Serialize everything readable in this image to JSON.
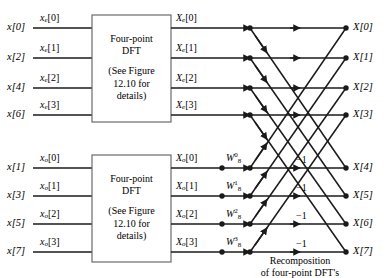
{
  "figure": {
    "line_color": "#1a1a1a",
    "box_stroke": "#6b6b6b",
    "text_color": "#000000"
  },
  "inputs": {
    "even": [
      {
        "x_label": "x[0]",
        "seq_name": "x",
        "seq_sub": "e",
        "seq_index": "[0]",
        "row": 0
      },
      {
        "x_label": "x[2]",
        "seq_name": "x",
        "seq_sub": "e",
        "seq_index": "[1]",
        "row": 1
      },
      {
        "x_label": "x[4]",
        "seq_name": "x",
        "seq_sub": "e",
        "seq_index": "[2]",
        "row": 2
      },
      {
        "x_label": "x[6]",
        "seq_name": "x",
        "seq_sub": "e",
        "seq_index": "[3]",
        "row": 3
      }
    ],
    "odd": [
      {
        "x_label": "x[1]",
        "seq_name": "x",
        "seq_sub": "o",
        "seq_index": "[0]",
        "row": 4
      },
      {
        "x_label": "x[3]",
        "seq_name": "x",
        "seq_sub": "o",
        "seq_index": "[1]",
        "row": 5
      },
      {
        "x_label": "x[5]",
        "seq_name": "x",
        "seq_sub": "o",
        "seq_index": "[2]",
        "row": 6
      },
      {
        "x_label": "x[7]",
        "seq_name": "x",
        "seq_sub": "o",
        "seq_index": "[3]",
        "row": 7
      }
    ]
  },
  "blocks": {
    "top": {
      "line1": "Four-point",
      "line2": "DFT",
      "line3": "(See Figure",
      "line4": "12.10 for",
      "line5": "details)"
    },
    "bottom": {
      "line1": "Four-point",
      "line2": "DFT",
      "line3": "(See Figure",
      "line4": "12.10 for",
      "line5": "details)"
    }
  },
  "block_outputs": {
    "even": [
      {
        "name": "X",
        "sub": "e",
        "index": "[0]"
      },
      {
        "name": "X",
        "sub": "e",
        "index": "[1]"
      },
      {
        "name": "X",
        "sub": "e",
        "index": "[2]"
      },
      {
        "name": "X",
        "sub": "e",
        "index": "[3]"
      }
    ],
    "odd": [
      {
        "name": "X",
        "sub": "o",
        "index": "[0]"
      },
      {
        "name": "X",
        "sub": "o",
        "index": "[1]"
      },
      {
        "name": "X",
        "sub": "o",
        "index": "[2]"
      },
      {
        "name": "X",
        "sub": "o",
        "index": "[3]"
      }
    ]
  },
  "twiddles": [
    {
      "name": "W",
      "sup": "0",
      "sub": "8"
    },
    {
      "name": "W",
      "sup": "1",
      "sub": "8"
    },
    {
      "name": "W",
      "sup": "2",
      "sub": "8"
    },
    {
      "name": "W",
      "sup": "3",
      "sub": "8"
    }
  ],
  "negative_ones": [
    "−1",
    "−1",
    "−1",
    "−1"
  ],
  "outputs": [
    "X[0]",
    "X[1]",
    "X[2]",
    "X[3]",
    "X[4]",
    "X[5]",
    "X[6]",
    "X[7]"
  ],
  "caption": {
    "line1": "Recomposition",
    "line2": "of four-point DFT's"
  }
}
